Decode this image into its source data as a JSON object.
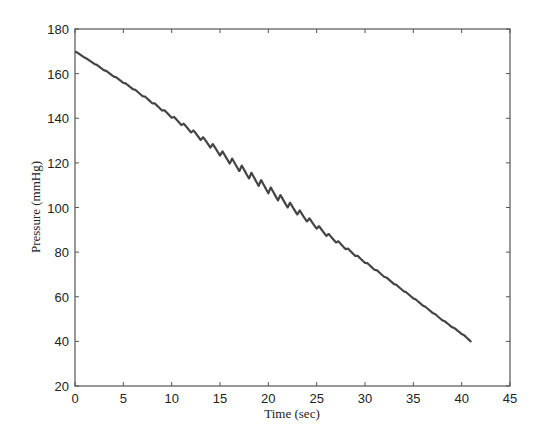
{
  "chart_data": {
    "type": "line",
    "title": "",
    "xlabel": "Time (sec)",
    "ylabel": "Pressure (mmHg)",
    "xlim": [
      0,
      45
    ],
    "ylim": [
      20,
      180
    ],
    "xticks": [
      0,
      5,
      10,
      15,
      20,
      25,
      30,
      35,
      40,
      45
    ],
    "yticks": [
      20,
      40,
      60,
      80,
      100,
      120,
      140,
      160,
      180
    ],
    "grid": false,
    "legend": null,
    "line_color": "#444444",
    "series": [
      {
        "name": "Cuff pressure",
        "description": "Deflating cuff pressure with small oscillometric pulses (~1 per second), largest between ~14 and ~26 sec",
        "x": [
          0,
          2,
          4,
          6,
          8,
          10,
          12,
          14,
          16,
          18,
          20,
          22,
          24,
          26,
          28,
          30,
          32,
          34,
          36,
          38,
          40,
          41
        ],
        "values": [
          170,
          164.5,
          159,
          153.5,
          147.5,
          141.5,
          135.5,
          129.5,
          123,
          117,
          111,
          105,
          99,
          93,
          87.5,
          82,
          76.5,
          71,
          65.5,
          60,
          55,
          52
        ]
      }
    ],
    "pulse": {
      "period_sec": 1.0,
      "start_sec": 6,
      "end_sec": 41,
      "peak_amplitude_mmHg": 3.2,
      "peak_time_sec": 19
    }
  }
}
